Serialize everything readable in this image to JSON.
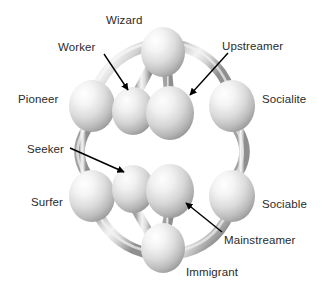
{
  "figure": {
    "type": "node-link-3d-cage-diagram",
    "background_color": "#ffffff",
    "label_color": "#2b2b2b",
    "sphere_fill_light": "#fdfdfd",
    "sphere_fill_mid": "#d8d8d8",
    "sphere_fill_dark": "#9a9a9a",
    "bond_fill_light": "#f2f2f2",
    "bond_fill_mid": "#cfcfcf",
    "bond_fill_dark": "#8f8f8f",
    "arrow_color": "#000000"
  },
  "labels": [
    {
      "id": "wizard",
      "text": "Wizard",
      "x": 106,
      "y": 14,
      "align": "left",
      "has_arrow": false
    },
    {
      "id": "worker",
      "text": "Worker",
      "x": 58,
      "y": 41,
      "align": "left",
      "has_arrow": true
    },
    {
      "id": "upstreamer",
      "text": "Upstreamer",
      "x": 222,
      "y": 40,
      "align": "left",
      "has_arrow": true
    },
    {
      "id": "pioneer",
      "text": "Pioneer",
      "x": 18,
      "y": 93,
      "align": "left",
      "has_arrow": false
    },
    {
      "id": "socialite",
      "text": "Socialite",
      "x": 262,
      "y": 93,
      "align": "left",
      "has_arrow": false
    },
    {
      "id": "seeker",
      "text": "Seeker",
      "x": 27,
      "y": 143,
      "align": "left",
      "has_arrow": true
    },
    {
      "id": "surfer",
      "text": "Surfer",
      "x": 31,
      "y": 196,
      "align": "left",
      "has_arrow": false
    },
    {
      "id": "sociable",
      "text": "Sociable",
      "x": 262,
      "y": 198,
      "align": "left",
      "has_arrow": false
    },
    {
      "id": "mainstreamer",
      "text": "Mainstreamer",
      "x": 224,
      "y": 234,
      "align": "left",
      "has_arrow": true
    },
    {
      "id": "immigrant",
      "text": "Immigrant",
      "x": 186,
      "y": 266,
      "align": "left",
      "has_arrow": false
    }
  ],
  "nodes": [
    {
      "id": "wizard",
      "label": "Wizard",
      "cx": 163,
      "cy": 52,
      "rx": 22,
      "ry": 25,
      "layer": "outer-top"
    },
    {
      "id": "pioneer",
      "label": "Pioneer",
      "cx": 92,
      "cy": 106,
      "rx": 23,
      "ry": 26,
      "layer": "outer-front-left"
    },
    {
      "id": "socialite",
      "label": "Socialite",
      "cx": 232,
      "cy": 106,
      "rx": 23,
      "ry": 26,
      "layer": "outer-front-right"
    },
    {
      "id": "surfer",
      "label": "Surfer",
      "cx": 92,
      "cy": 196,
      "rx": 23,
      "ry": 26,
      "layer": "outer-back-left"
    },
    {
      "id": "sociable",
      "label": "Sociable",
      "cx": 232,
      "cy": 196,
      "rx": 23,
      "ry": 26,
      "layer": "outer-back-right"
    },
    {
      "id": "immigrant",
      "label": "Immigrant",
      "cx": 163,
      "cy": 248,
      "rx": 22,
      "ry": 25,
      "layer": "outer-bottom"
    },
    {
      "id": "worker",
      "label": "Worker",
      "cx": 133,
      "cy": 111,
      "rx": 21,
      "ry": 24,
      "layer": "inner-upper-left"
    },
    {
      "id": "upstreamer",
      "label": "Upstreamer",
      "cx": 170,
      "cy": 113,
      "rx": 24,
      "ry": 27,
      "layer": "inner-upper-right"
    },
    {
      "id": "seeker",
      "label": "Seeker",
      "cx": 133,
      "cy": 189,
      "rx": 21,
      "ry": 24,
      "layer": "inner-lower-left"
    },
    {
      "id": "mainstreamer",
      "label": "Mainstreamer",
      "cx": 170,
      "cy": 191,
      "rx": 24,
      "ry": 27,
      "layer": "inner-lower-right"
    }
  ],
  "edges": [
    {
      "from": "pioneer",
      "to": "wizard",
      "style": "curved-arc"
    },
    {
      "from": "wizard",
      "to": "socialite",
      "style": "curved-arc"
    },
    {
      "from": "pioneer",
      "to": "surfer",
      "style": "curved-arc"
    },
    {
      "from": "socialite",
      "to": "sociable",
      "style": "curved-arc"
    },
    {
      "from": "surfer",
      "to": "immigrant",
      "style": "curved-arc"
    },
    {
      "from": "immigrant",
      "to": "sociable",
      "style": "curved-arc"
    },
    {
      "from": "wizard",
      "to": "upstreamer",
      "style": "straight-vertical"
    },
    {
      "from": "wizard",
      "to": "worker",
      "style": "straight-vertical"
    },
    {
      "from": "worker",
      "to": "seeker",
      "style": "straight-vertical"
    },
    {
      "from": "upstreamer",
      "to": "mainstreamer",
      "style": "straight-vertical"
    },
    {
      "from": "seeker",
      "to": "immigrant",
      "style": "straight-vertical"
    },
    {
      "from": "mainstreamer",
      "to": "immigrant",
      "style": "straight-vertical"
    }
  ],
  "arrows": [
    {
      "id": "worker-arrow",
      "from_x": 104,
      "from_y": 54,
      "to_x": 128,
      "to_y": 90
    },
    {
      "id": "upstreamer-arrow",
      "from_x": 228,
      "from_y": 53,
      "to_x": 190,
      "to_y": 95
    },
    {
      "id": "seeker-arrow",
      "from_x": 70,
      "from_y": 148,
      "to_x": 124,
      "to_y": 172
    },
    {
      "id": "mainstreamer-arrow",
      "from_x": 222,
      "from_y": 232,
      "to_x": 186,
      "to_y": 203
    }
  ]
}
